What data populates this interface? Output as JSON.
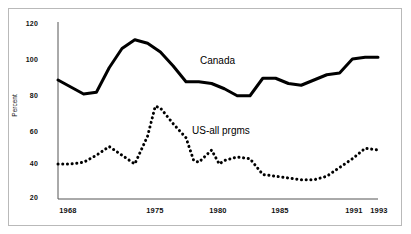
{
  "chart_data": {
    "type": "line",
    "title": "",
    "xlabel": "",
    "ylabel": "Percent",
    "xlim": [
      1968,
      1993
    ],
    "ylim": [
      20,
      120
    ],
    "grid": false,
    "legend_position": "inline-annotation",
    "y_ticks": [
      20,
      40,
      60,
      80,
      100,
      120
    ],
    "x_ticks": [
      1968,
      1975,
      1980,
      1985,
      1991,
      1993
    ],
    "x": [
      1968,
      1969,
      1970,
      1971,
      1972,
      1973,
      1974,
      1975,
      1976,
      1977,
      1978,
      1979,
      1980,
      1981,
      1982,
      1983,
      1984,
      1985,
      1986,
      1987,
      1988,
      1989,
      1990,
      1991,
      1992,
      1993
    ],
    "series": [
      {
        "name": "Canada",
        "style": "solid",
        "color": "#000000",
        "values": [
          88,
          84,
          80,
          81,
          95,
          106,
          111,
          109,
          104,
          96,
          87,
          87,
          86,
          83,
          79,
          79,
          89,
          89,
          86,
          85,
          88,
          91,
          92,
          100,
          101,
          101
        ]
      },
      {
        "name": "US-all prgms",
        "style": "dotted",
        "color": "#000000",
        "values": [
          40,
          40,
          41,
          44,
          47,
          50,
          45,
          40,
          43,
          56,
          73,
          71,
          63,
          55,
          45,
          41,
          41,
          44,
          49,
          40,
          42,
          44,
          43,
          40,
          36,
          32
        ]
      }
    ],
    "series_canada_full": {
      "name": "Canada",
      "x": [
        1968,
        1969,
        1970,
        1971,
        1972,
        1973,
        1974,
        1975,
        1976,
        1977,
        1978,
        1979,
        1980,
        1981,
        1982,
        1983,
        1984,
        1985,
        1986,
        1987,
        1988,
        1989,
        1990,
        1991,
        1992,
        1993
      ],
      "values": [
        88,
        84,
        80,
        81,
        95,
        106,
        111,
        109,
        104,
        96,
        87,
        87,
        86,
        83,
        79,
        79,
        89,
        89,
        86,
        85,
        88,
        91,
        92,
        100,
        101,
        101,
        95,
        83
      ]
    },
    "annotations": [
      {
        "text": "Canada",
        "x": 1979.5,
        "y": 97
      },
      {
        "text": "US-all prgms",
        "x": 1979.0,
        "y": 60
      }
    ]
  },
  "axis": {
    "y_tick_labels": [
      "120",
      "100",
      "80",
      "60",
      "40",
      "20"
    ],
    "x_tick_labels": [
      "1968",
      "1975",
      "1980",
      "1985",
      "1991",
      "1993"
    ],
    "y_axis_title": "Percent"
  },
  "annotations": {
    "canada_label": "Canada",
    "us_label": "US-all prgms"
  }
}
